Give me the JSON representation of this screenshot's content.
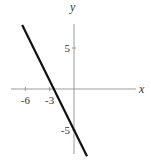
{
  "chart_data": {
    "type": "line",
    "title": "",
    "xlabel": "x",
    "ylabel": "y",
    "xlim": [
      -8,
      8
    ],
    "ylim": [
      -9.5,
      10
    ],
    "grid": false,
    "x_ticks": [
      {
        "value": -6,
        "label": "-6"
      },
      {
        "value": -3,
        "label": "-3"
      }
    ],
    "y_ticks": [
      {
        "value": 5,
        "label": "5"
      },
      {
        "value": -5,
        "label": "-5"
      }
    ],
    "series": [
      {
        "name": "y = -2x - 5",
        "equation": "y = -2x - 5",
        "color": "#111111",
        "x": [
          -6.4,
          1.6
        ],
        "y": [
          7.8,
          -8.2
        ]
      }
    ]
  }
}
